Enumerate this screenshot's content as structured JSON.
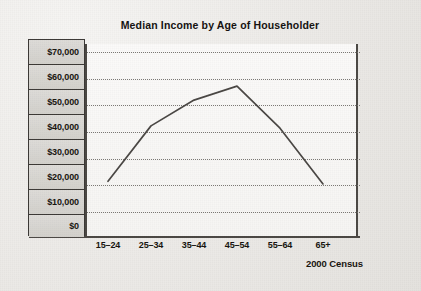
{
  "figure": {
    "title": "Median Income by Age of Householder",
    "source_label": "2000 Census"
  },
  "axis": {
    "y_ticks": [
      "$70,000",
      "$60,000",
      "$50,000",
      "$40,000",
      "$30,000",
      "$20,000",
      "$10,000",
      "$0"
    ],
    "x_ticks": [
      "15–24",
      "25–34",
      "35–44",
      "45–54",
      "55–64",
      "65+"
    ]
  },
  "colors": {
    "line": "#4a4744",
    "axis": "#4b4844",
    "gridline": "#6d6a66",
    "label_cell_fill": "#d8d6d2",
    "plot_fill": "#faf9f7",
    "page_background": "#eceae7",
    "text": "#17140f"
  },
  "chart_data": {
    "type": "line",
    "title": "Median Income by Age of Householder",
    "subtitle": "",
    "xlabel": "",
    "ylabel": "",
    "annotation": "2000 Census",
    "categories": [
      "15–24",
      "25–34",
      "35–44",
      "45–54",
      "55–64",
      "65+"
    ],
    "values": [
      20800,
      41900,
      51700,
      57000,
      41000,
      19800
    ],
    "series": [
      {
        "name": "Median Income",
        "values": [
          20800,
          41900,
          51700,
          57000,
          41000,
          19800
        ]
      }
    ],
    "ylim": [
      0,
      70000
    ],
    "ytick_values": [
      0,
      10000,
      20000,
      30000,
      40000,
      50000,
      60000,
      70000
    ],
    "ytick_labels": [
      "$0",
      "$10,000",
      "$20,000",
      "$30,000",
      "$40,000",
      "$50,000",
      "$60,000",
      "$70,000"
    ],
    "grid": "horizontal-dotted",
    "legend": "none",
    "line_color": "#4a4744",
    "markers": "none"
  }
}
